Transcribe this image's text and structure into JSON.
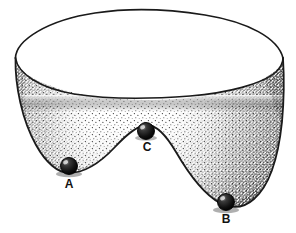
{
  "figure": {
    "caption": "",
    "background_color": "#ffffff",
    "ink_color": "#1a1a1a",
    "stipple_color": "#2b2b2b",
    "interior_fill": "#ffffff",
    "wall_fill": "#fafafa",
    "ball_color": "#141414",
    "ball_highlight_color": "#f2f2f2"
  },
  "objects": {
    "bowl": {
      "name": "bowl",
      "rim_outer_label": "bowl-rim-outer-edge",
      "rim_inner_label": "bowl-rim-inner-edge",
      "wall_label": "bowl-outer-wall",
      "bottom_label": "bowl-wavy-bottom-contour"
    },
    "balls": [
      {
        "id": "A",
        "label": "A",
        "name": "ball-a",
        "cx": 69,
        "cy": 166,
        "r": 8.5,
        "label_x": 69,
        "label_y": 185,
        "position_description": "left well"
      },
      {
        "id": "C",
        "label": "C",
        "name": "ball-c",
        "cx": 146,
        "cy": 131,
        "r": 8.5,
        "label_x": 147,
        "label_y": 148,
        "position_description": "central saddle hump"
      },
      {
        "id": "B",
        "label": "B",
        "name": "ball-b",
        "cx": 226,
        "cy": 202,
        "r": 8.5,
        "label_x": 226,
        "label_y": 220,
        "position_description": "right deep well"
      }
    ]
  }
}
